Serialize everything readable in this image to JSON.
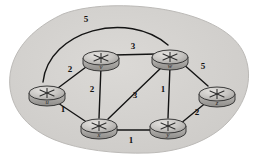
{
  "figure": {
    "kind": "network-topology-graph",
    "background_color": "#ffffff",
    "cloud_fill": "#d4d2cf",
    "cloud_stroke": "#b9b7b4",
    "edge_color": "#1a1a1a",
    "node_top_fill": "#c9c7c4",
    "node_side_fill": "#a9a7a4",
    "node_stroke": "#2a2a2a"
  },
  "nodes": [
    {
      "id": "u",
      "label": "u",
      "cx": 47,
      "cy": 93,
      "icon": "router-icon"
    },
    {
      "id": "v",
      "label": "v",
      "cx": 101,
      "cy": 58,
      "icon": "router-icon"
    },
    {
      "id": "w",
      "label": "w",
      "cx": 170,
      "cy": 57,
      "icon": "router-icon"
    },
    {
      "id": "x",
      "label": "x",
      "cx": 99,
      "cy": 126,
      "icon": "router-icon"
    },
    {
      "id": "y",
      "label": "y",
      "cx": 168,
      "cy": 126,
      "icon": "router-icon"
    },
    {
      "id": "z",
      "label": "z",
      "cx": 217,
      "cy": 94,
      "icon": "router-icon"
    }
  ],
  "edges": [
    {
      "id": "u-w",
      "from": "u",
      "to": "w",
      "weight": "5",
      "shape": "arc",
      "label_x": 86,
      "label_y": 22
    },
    {
      "id": "u-v",
      "from": "u",
      "to": "v",
      "weight": "2",
      "shape": "straight",
      "label_x": 70,
      "label_y": 72
    },
    {
      "id": "v-w",
      "from": "v",
      "to": "w",
      "weight": "3",
      "shape": "straight",
      "label_x": 133,
      "label_y": 49
    },
    {
      "id": "w-z",
      "from": "w",
      "to": "z",
      "weight": "5",
      "shape": "straight",
      "label_x": 203,
      "label_y": 69
    },
    {
      "id": "v-x",
      "from": "v",
      "to": "x",
      "weight": "2",
      "shape": "straight",
      "label_x": 92,
      "label_y": 92
    },
    {
      "id": "w-x",
      "from": "w",
      "to": "x",
      "weight": "3",
      "shape": "straight",
      "label_x": 135,
      "label_y": 98
    },
    {
      "id": "w-y",
      "from": "w",
      "to": "y",
      "weight": "1",
      "shape": "straight",
      "label_x": 163,
      "label_y": 92
    },
    {
      "id": "u-x",
      "from": "u",
      "to": "x",
      "weight": "1",
      "shape": "straight",
      "label_x": 63,
      "label_y": 112
    },
    {
      "id": "x-y",
      "from": "x",
      "to": "y",
      "weight": "1",
      "shape": "straight",
      "label_x": 131,
      "label_y": 143
    },
    {
      "id": "y-z",
      "from": "y",
      "to": "z",
      "weight": "2",
      "shape": "straight",
      "label_x": 197,
      "label_y": 115
    }
  ]
}
